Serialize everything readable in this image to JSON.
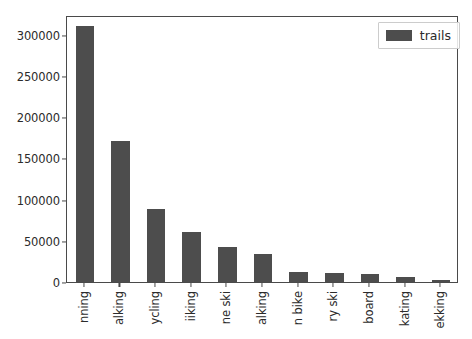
{
  "chart_data": {
    "type": "bar",
    "title": "",
    "xlabel": "",
    "ylabel": "",
    "grid": false,
    "legend_position": "upper right",
    "bar_color": "#4d4d4d",
    "ylim": [
      0,
      324000
    ],
    "yticks": [
      0,
      50000,
      100000,
      150000,
      200000,
      250000,
      300000
    ],
    "ytick_labels": [
      "0",
      "50000",
      "100000",
      "150000",
      "200000",
      "250000",
      "300000"
    ],
    "categories": [
      "nning",
      "alking",
      "ycling",
      "iiking",
      "ne ski",
      "alking",
      "n bike",
      "ry ski",
      "board",
      "kating",
      "ekking"
    ],
    "series": [
      {
        "name": "trails",
        "values": [
          311000,
          171000,
          88700,
          60700,
          42500,
          34000,
          12000,
          11000,
          10000,
          6000,
          2500
        ]
      }
    ]
  },
  "legend": {
    "entries": [
      {
        "label": "trails",
        "color": "#4d4d4d"
      }
    ]
  },
  "caption": {
    "text": ""
  }
}
